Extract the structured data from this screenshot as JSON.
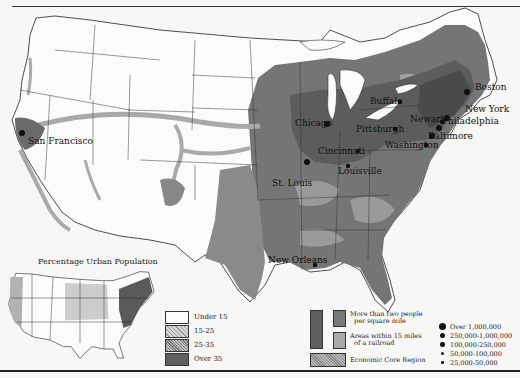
{
  "map": {
    "title": "Percentage Urban Population",
    "cities": [
      {
        "name": "Boston",
        "x": 475,
        "y": 90,
        "dot_x": 467,
        "dot_y": 92,
        "size": "large"
      },
      {
        "name": "New York",
        "x": 465,
        "y": 112,
        "dot_x": 447,
        "dot_y": 118,
        "size": "large"
      },
      {
        "name": "Philadelphia",
        "x": 442,
        "y": 124,
        "dot_x": 439,
        "dot_y": 128,
        "size": "large"
      },
      {
        "name": "Newark",
        "x": 410,
        "y": 122,
        "dot_x": 442,
        "dot_y": 122,
        "size": "medium"
      },
      {
        "name": "Baltimore",
        "x": 428,
        "y": 139,
        "dot_x": 432,
        "dot_y": 136,
        "size": "large"
      },
      {
        "name": "Washington",
        "x": 385,
        "y": 148,
        "dot_x": 426,
        "dot_y": 145,
        "size": "medium"
      },
      {
        "name": "Buffalo",
        "x": 370,
        "y": 104,
        "dot_x": 400,
        "dot_y": 102,
        "size": "medium"
      },
      {
        "name": "Pittsburgh",
        "x": 356,
        "y": 132,
        "dot_x": 395,
        "dot_y": 129,
        "size": "medium"
      },
      {
        "name": "Chicago",
        "x": 295,
        "y": 126,
        "dot_x": 327,
        "dot_y": 124,
        "size": "large"
      },
      {
        "name": "Cincinnati",
        "x": 318,
        "y": 154,
        "dot_x": 358,
        "dot_y": 151,
        "size": "medium"
      },
      {
        "name": "Louisville",
        "x": 338,
        "y": 174,
        "dot_x": 348,
        "dot_y": 166,
        "size": "medium"
      },
      {
        "name": "St. Louis",
        "x": 272,
        "y": 186,
        "dot_x": 307,
        "dot_y": 162,
        "size": "large"
      },
      {
        "name": "San Francisco",
        "x": 28,
        "y": 144,
        "dot_x": 22,
        "dot_y": 133,
        "size": "large"
      },
      {
        "name": "New Orleans",
        "x": 268,
        "y": 263,
        "dot_x": 315,
        "dot_y": 265,
        "size": "medium"
      }
    ]
  },
  "legend_urban": {
    "items": [
      {
        "label": "Under 15",
        "pattern": "white"
      },
      {
        "label": "15-25",
        "pattern": "light-hatch"
      },
      {
        "label": "25-35",
        "pattern": "dense-hatch"
      },
      {
        "label": "Over 35",
        "pattern": "dark"
      }
    ]
  },
  "legend_density": {
    "items": [
      {
        "label_line1": "More than two people",
        "label_line2": "per square mile"
      },
      {
        "label_line1": "Areas within 15 miles",
        "label_line2": "of a railroad"
      },
      {
        "label_line1": "Economic Core Region",
        "label_line2": ""
      }
    ]
  },
  "legend_cities": {
    "items": [
      {
        "label": "Over 1,000,000",
        "size": 7
      },
      {
        "label": "250,000-1,000,000",
        "size": 5.5
      },
      {
        "label": "100,000-250,000",
        "size": 4.5
      },
      {
        "label": "50,000-100,000",
        "size": 3.5
      },
      {
        "label": "25,000-50,000",
        "size": 2.5
      }
    ]
  },
  "colors": {
    "dense": "#6e6e6e",
    "railroad": "#a8a8a8",
    "core": "#4a4a4a",
    "background": "#f7f7f5"
  }
}
